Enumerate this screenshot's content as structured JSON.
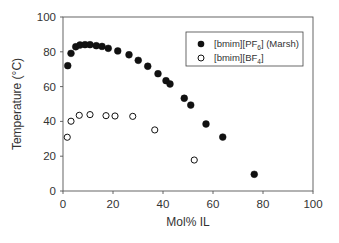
{
  "chart_data": {
    "type": "scatter",
    "title": "",
    "xlabel": "Mol% IL",
    "ylabel": "Temperature (°C)",
    "xlim": [
      0,
      100
    ],
    "ylim": [
      0,
      100
    ],
    "xticks": [
      0,
      20,
      40,
      60,
      80,
      100
    ],
    "yticks": [
      0,
      20,
      40,
      60,
      80,
      100
    ],
    "grid": false,
    "legend_position": "upper right",
    "series": [
      {
        "name": "[bmim][PF6] (Marsh)",
        "legend_main": "[bmim][PF",
        "legend_sub": "6",
        "legend_suffix": "] (Marsh)",
        "marker": "filled-circle",
        "color": "#111111",
        "x": [
          1.9,
          3.2,
          5.1,
          6.8,
          8.8,
          10.8,
          13.3,
          15.6,
          18.1,
          21.9,
          26.4,
          30.1,
          33.9,
          38.0,
          41.2,
          42.8,
          48.5,
          51.1,
          57.2,
          63.9,
          76.5
        ],
        "y": [
          72.0,
          79.1,
          82.9,
          83.9,
          84.1,
          84.1,
          83.5,
          83.1,
          82.0,
          80.5,
          78.3,
          75.1,
          71.7,
          67.4,
          63.4,
          61.5,
          53.3,
          49.4,
          38.5,
          31.0,
          9.6
        ]
      },
      {
        "name": "[bmim][BF4]",
        "legend_main": "[bmim][BF",
        "legend_sub": "4",
        "legend_suffix": "]",
        "marker": "open-circle",
        "color": "#111111",
        "x": [
          1.7,
          3.2,
          6.5,
          10.8,
          17.2,
          20.8,
          27.9,
          36.7,
          52.5
        ],
        "y": [
          30.9,
          40.1,
          43.5,
          43.9,
          43.3,
          43.1,
          42.9,
          35.1,
          17.8
        ]
      }
    ]
  }
}
